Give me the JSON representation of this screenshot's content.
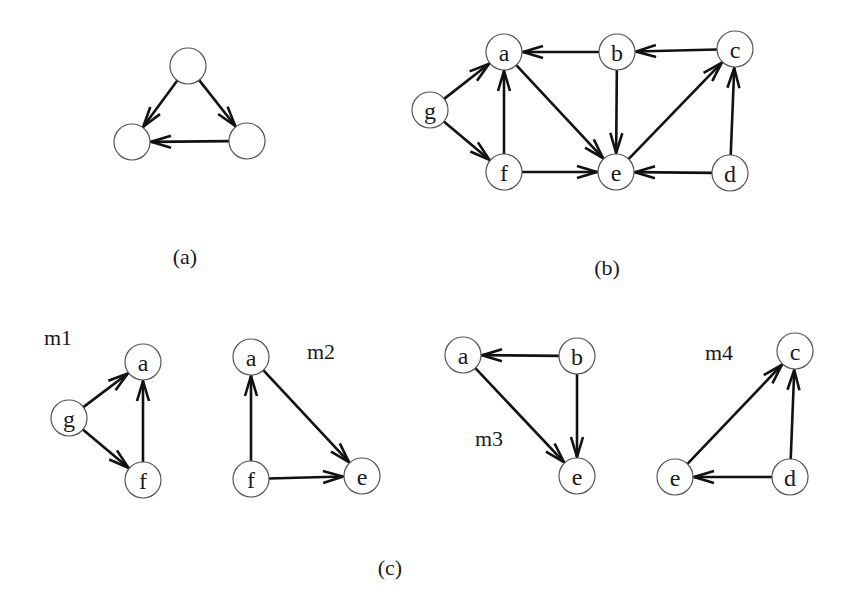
{
  "figure": {
    "node_radius": 18,
    "colors": {
      "edge": "#111111",
      "node_stroke": "#555555",
      "node_fill": "#ffffff",
      "text": "#1a1a1a"
    },
    "panels": [
      {
        "id": "a",
        "caption": "(a)",
        "caption_pos": [
          185,
          256
        ],
        "label": "",
        "nodes": [
          {
            "id": "top",
            "label": "",
            "x": 188,
            "y": 66
          },
          {
            "id": "left",
            "label": "",
            "x": 132,
            "y": 142
          },
          {
            "id": "right",
            "label": "",
            "x": 247,
            "y": 141
          }
        ],
        "edges": [
          {
            "from": "top",
            "to": "left"
          },
          {
            "from": "top",
            "to": "right"
          },
          {
            "from": "right",
            "to": "left"
          }
        ]
      },
      {
        "id": "b",
        "caption": "(b)",
        "caption_pos": [
          607,
          267
        ],
        "label": "",
        "nodes": [
          {
            "id": "a",
            "label": "a",
            "x": 504,
            "y": 52
          },
          {
            "id": "b",
            "label": "b",
            "x": 617,
            "y": 52
          },
          {
            "id": "c",
            "label": "c",
            "x": 735,
            "y": 49
          },
          {
            "id": "g",
            "label": "g",
            "x": 430,
            "y": 110
          },
          {
            "id": "f",
            "label": "f",
            "x": 504,
            "y": 172
          },
          {
            "id": "e",
            "label": "e",
            "x": 616,
            "y": 172
          },
          {
            "id": "d",
            "label": "d",
            "x": 730,
            "y": 173
          }
        ],
        "edges": [
          {
            "from": "g",
            "to": "a"
          },
          {
            "from": "g",
            "to": "f"
          },
          {
            "from": "f",
            "to": "a"
          },
          {
            "from": "b",
            "to": "a"
          },
          {
            "from": "c",
            "to": "b"
          },
          {
            "from": "a",
            "to": "e"
          },
          {
            "from": "b",
            "to": "e"
          },
          {
            "from": "f",
            "to": "e"
          },
          {
            "from": "e",
            "to": "c"
          },
          {
            "from": "d",
            "to": "e"
          },
          {
            "from": "d",
            "to": "c"
          }
        ]
      },
      {
        "id": "m1",
        "caption": "",
        "label": "m1",
        "label_pos": [
          58,
          337
        ],
        "nodes": [
          {
            "id": "a",
            "label": "a",
            "x": 143,
            "y": 362
          },
          {
            "id": "g",
            "label": "g",
            "x": 69,
            "y": 418
          },
          {
            "id": "f",
            "label": "f",
            "x": 143,
            "y": 480
          }
        ],
        "edges": [
          {
            "from": "g",
            "to": "a"
          },
          {
            "from": "g",
            "to": "f"
          },
          {
            "from": "f",
            "to": "a"
          }
        ]
      },
      {
        "id": "m2",
        "caption": "",
        "label": "m2",
        "label_pos": [
          321,
          351
        ],
        "nodes": [
          {
            "id": "a",
            "label": "a",
            "x": 251,
            "y": 357
          },
          {
            "id": "f",
            "label": "f",
            "x": 251,
            "y": 479
          },
          {
            "id": "e",
            "label": "e",
            "x": 362,
            "y": 476
          }
        ],
        "edges": [
          {
            "from": "f",
            "to": "a"
          },
          {
            "from": "a",
            "to": "e"
          },
          {
            "from": "f",
            "to": "e"
          }
        ]
      },
      {
        "id": "m3",
        "caption": "",
        "label": "m3",
        "label_pos": [
          489,
          438
        ],
        "nodes": [
          {
            "id": "a",
            "label": "a",
            "x": 463,
            "y": 355
          },
          {
            "id": "b",
            "label": "b",
            "x": 577,
            "y": 356
          },
          {
            "id": "e",
            "label": "e",
            "x": 577,
            "y": 476
          }
        ],
        "edges": [
          {
            "from": "b",
            "to": "a"
          },
          {
            "from": "a",
            "to": "e"
          },
          {
            "from": "b",
            "to": "e"
          }
        ]
      },
      {
        "id": "m4",
        "caption": "",
        "label": "m4",
        "label_pos": [
          719,
          352
        ],
        "nodes": [
          {
            "id": "c",
            "label": "c",
            "x": 795,
            "y": 351
          },
          {
            "id": "e",
            "label": "e",
            "x": 675,
            "y": 477
          },
          {
            "id": "d",
            "label": "d",
            "x": 790,
            "y": 477
          }
        ],
        "edges": [
          {
            "from": "e",
            "to": "c"
          },
          {
            "from": "d",
            "to": "c"
          },
          {
            "from": "d",
            "to": "e"
          }
        ]
      }
    ],
    "bottom_caption": {
      "text": "(c)",
      "x": 390,
      "y": 567
    }
  }
}
